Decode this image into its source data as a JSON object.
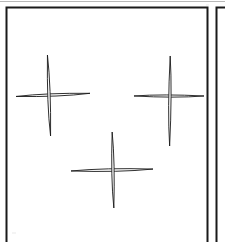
{
  "figure": {
    "background_color": "#ffffff",
    "ink_color": "#1a1a1a",
    "faint_ink_color": "#8a8a8a",
    "canvas": {
      "width": 225,
      "height": 242
    }
  },
  "frame": {
    "name": "main-panel-border",
    "x": 6.5,
    "y": 7.5,
    "width": 201,
    "height": 235,
    "stroke_width": 2.0,
    "bottom_open": true,
    "note": "Rectangular panel border; bottom edge runs past the image crop"
  },
  "top_rule": {
    "name": "page-top-rule",
    "x1": 0,
    "y1": 1.5,
    "x2": 225,
    "y2": 1.5,
    "stroke_width": 1.2,
    "color": "#b8b8b8"
  },
  "side_panel": {
    "name": "adjacent-panel-edge",
    "x": 216.5,
    "y_top": 7.5,
    "y_bottom": 242,
    "stroke_width": 2.0,
    "top_cap_x2": 225
  },
  "marks": [
    {
      "id": "cross-1",
      "label": "upper-left-cross",
      "center_x": 49,
      "center_y": 95,
      "horizontal": {
        "left": 16,
        "right": 90,
        "thickness": 5.0
      },
      "vertical": {
        "top": 55,
        "bottom": 136,
        "thickness": 5.2
      },
      "rotation_deg": -1.5
    },
    {
      "id": "cross-2",
      "label": "upper-right-cross",
      "center_x": 170,
      "center_y": 96,
      "horizontal": {
        "left": 134,
        "right": 204,
        "thickness": 4.6
      },
      "vertical": {
        "top": 56,
        "bottom": 146,
        "thickness": 5.0
      },
      "rotation_deg": 1.0
    },
    {
      "id": "cross-3",
      "label": "lower-center-cross",
      "center_x": 113,
      "center_y": 170,
      "horizontal": {
        "left": 71,
        "right": 153,
        "thickness": 5.4
      },
      "vertical": {
        "top": 132,
        "bottom": 208,
        "thickness": 5.0
      },
      "rotation_deg": -0.5
    }
  ]
}
